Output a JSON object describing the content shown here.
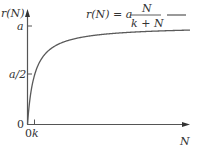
{
  "chart_data": {
    "type": "line",
    "title": "",
    "xlabel": "N",
    "ylabel": "r(N)",
    "legend": {
      "label_lhs": "r(N) = a",
      "numerator": "N",
      "denominator": "k + N",
      "position": "top-right"
    },
    "formula": "r(N) = a N / (k + N)",
    "y_ticks": [
      "0",
      "a/2",
      "a"
    ],
    "x_ticks": [
      "0",
      "k"
    ],
    "parameters": {
      "a": 1,
      "k": 1
    },
    "series": [
      {
        "name": "r(N) = a N/(k+N)",
        "x": [
          0,
          0.25,
          0.5,
          1,
          2,
          3,
          5,
          8,
          12,
          16,
          20,
          24
        ],
        "values": [
          0,
          0.2,
          0.333,
          0.5,
          0.667,
          0.75,
          0.833,
          0.889,
          0.923,
          0.941,
          0.952,
          0.96
        ]
      }
    ],
    "xlim": [
      0,
      24
    ],
    "ylim": [
      0,
      1
    ],
    "grid": false,
    "color": "#555555"
  },
  "labels": {
    "y_axis": "r(N)",
    "x_axis": "N",
    "tick_a": "a",
    "tick_half": "a/2",
    "tick_zero_y": "0",
    "tick_zero_x": "0",
    "tick_k": "k"
  }
}
